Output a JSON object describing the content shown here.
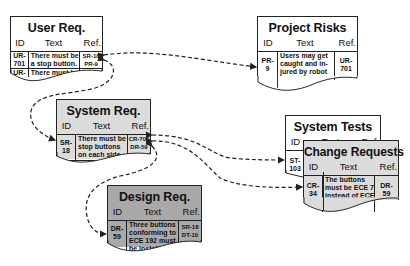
{
  "diagram": {
    "type": "traceability-diagram",
    "column_headers": {
      "id": "ID",
      "text": "Text",
      "ref": "Ref."
    },
    "documents": [
      {
        "key": "user_req",
        "title": "User Req.",
        "fill": "#ffffff",
        "rows": [
          {
            "id": "UR-701",
            "text": "There must be a stop button.",
            "ref": "SR-18 PR-9"
          },
          {
            "id": "UR-513",
            "text": "There must be a run b...",
            "ref": "SR-..."
          }
        ]
      },
      {
        "key": "project_risks",
        "title": "Project Risks",
        "fill": "#ffffff",
        "rows": [
          {
            "id": "PR-9",
            "text": "Users may get caught and injured by robot",
            "ref": "UR-701"
          }
        ]
      },
      {
        "key": "system_req",
        "title": "System Req.",
        "fill": "#dcdcdc",
        "rows": [
          {
            "id": "SR-18",
            "text": "There must be stop buttons on each side.",
            "ref": "CR-701 DR-59 ST-103"
          },
          {
            "id": "SR-...",
            "text": "There...",
            "ref": ""
          }
        ]
      },
      {
        "key": "system_tests",
        "title": "System Tests",
        "fill": "#ffffff",
        "rows": [
          {
            "id": "ST-103",
            "text": "",
            "ref": ""
          }
        ]
      },
      {
        "key": "change_requests",
        "title": "Change Requests",
        "fill": "#dcdcdc",
        "rows": [
          {
            "id": "CR-34",
            "text": "The buttons must be ECE 7 instead of ECE 192",
            "ref": "DR-59"
          }
        ]
      },
      {
        "key": "design_req",
        "title": "Design Req.",
        "fill": "#a9a9a9",
        "rows": [
          {
            "id": "DR-59",
            "text": "Three buttons conforming to ECE 192 must be install...",
            "ref": "SR-18 DT-10"
          }
        ]
      }
    ],
    "links": [
      {
        "from": "UR-701",
        "to": "PR-9",
        "style": "dashed",
        "bidirectional": true
      },
      {
        "from": "UR-701",
        "to": "SR-18",
        "style": "dashed"
      },
      {
        "from": "SR-18",
        "to": "ST-103",
        "style": "dashed",
        "bidirectional": true
      },
      {
        "from": "SR-18",
        "to": "CR-34",
        "style": "dashed",
        "bidirectional": true
      },
      {
        "from": "SR-18",
        "to": "DR-59",
        "style": "dashed"
      }
    ]
  },
  "ui": {
    "user_req": {
      "title": "User Req.",
      "r1": {
        "id": "UR-\n701",
        "text": "There must be\na stop button.",
        "ref": "SR-18\nPR-9"
      },
      "r2": {
        "id": "UR-\n513",
        "text": "There must be\na run b",
        "ref": "SR-"
      }
    },
    "project_risks": {
      "title": "Project Risks",
      "r1": {
        "id": "PR-\n9",
        "text": "Users may get\ncaught and in-\njured by robot",
        "ref": "UR-\n701"
      }
    },
    "system_req": {
      "title": "System Req.",
      "r1": {
        "id": "SR-\n18",
        "text": "There must be\nstop buttons\non each side.",
        "ref": "CR-701\nDR-59\nST-103"
      },
      "r2": {
        "id": "SR-",
        "text": "There",
        "ref": ""
      }
    },
    "system_tests": {
      "title": "System Tests",
      "r1": {
        "id": "ST-\n103",
        "text": "",
        "ref": ""
      }
    },
    "change_requests": {
      "title": "Change Requests",
      "r1": {
        "id": "CR-\n34",
        "text": "The buttons\nmust be ECE 7\ninstead of ECE\n192",
        "ref": "DR-\n59"
      }
    },
    "design_req": {
      "title": "Design Req.",
      "r1": {
        "id": "DR-\n59",
        "text": "Three buttons\nconforming to\nECE 192 must\nbe install",
        "ref": "SR-18\nDT-10"
      }
    }
  }
}
